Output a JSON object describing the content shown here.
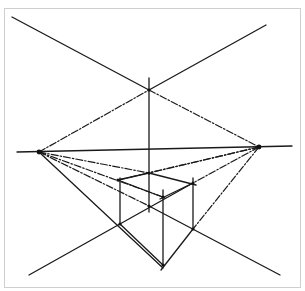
{
  "figure": {
    "colors": {
      "ink": "#1a1a1a",
      "background": "#ffffff",
      "frame": "#cfcfcf"
    }
  },
  "points": {
    "left_vp": {
      "x": 39,
      "y": 152
    },
    "right_vp": {
      "x": 259,
      "y": 147
    },
    "top_cross": {
      "x": 149,
      "y": 90
    },
    "box_top_back": {
      "x": 149,
      "y": 173
    },
    "box_top_left": {
      "x": 118,
      "y": 180
    },
    "box_top_right": {
      "x": 193,
      "y": 183
    },
    "box_top_front": {
      "x": 163,
      "y": 197
    },
    "box_bottom_back": {
      "x": 149,
      "y": 206
    },
    "box_bottom_left": {
      "x": 120,
      "y": 224
    },
    "box_bottom_right": {
      "x": 193,
      "y": 229
    },
    "box_bottom_front": {
      "x": 163,
      "y": 265
    }
  },
  "lines": {
    "solid": [
      {
        "name": "horizon-line",
        "x1": 17,
        "y1": 152,
        "x2": 292,
        "y2": 146
      },
      {
        "name": "upper-left-diagonal",
        "x1": 12,
        "y1": 17,
        "x2": 149,
        "y2": 90
      },
      {
        "name": "upper-right-diagonal",
        "x1": 266,
        "y1": 25,
        "x2": 149,
        "y2": 90
      },
      {
        "name": "center-vertical",
        "x1": 149,
        "y1": 78,
        "x2": 149,
        "y2": 212
      },
      {
        "name": "lower-left-diagonal",
        "x1": 29,
        "y1": 275,
        "x2": 193,
        "y2": 183
      },
      {
        "name": "lower-right-diagonal",
        "x1": 149,
        "y1": 206,
        "x2": 280,
        "y2": 275
      },
      {
        "name": "left-vp-to-front-bottom",
        "x1": 39,
        "y1": 152,
        "x2": 163,
        "y2": 268
      },
      {
        "name": "box-edge-left-vertical",
        "x1": 120,
        "y1": 178,
        "x2": 120,
        "y2": 224
      },
      {
        "name": "box-edge-front-vertical",
        "x1": 163,
        "y1": 190,
        "x2": 163,
        "y2": 265
      },
      {
        "name": "box-edge-right-vertical",
        "x1": 193,
        "y1": 178,
        "x2": 193,
        "y2": 229
      },
      {
        "name": "box-top-left-to-back",
        "x1": 118,
        "y1": 180,
        "x2": 149,
        "y2": 173
      },
      {
        "name": "box-top-back-to-right",
        "x1": 149,
        "y1": 173,
        "x2": 196,
        "y2": 185
      },
      {
        "name": "box-top-left-to-front",
        "x1": 118,
        "y1": 180,
        "x2": 165,
        "y2": 198
      },
      {
        "name": "box-top-front-to-right",
        "x1": 160,
        "y1": 199,
        "x2": 193,
        "y2": 183
      },
      {
        "name": "box-bottom-left-to-front",
        "x1": 120,
        "y1": 224,
        "x2": 163,
        "y2": 265
      },
      {
        "name": "box-bottom-right-to-front",
        "x1": 193,
        "y1": 229,
        "x2": 161,
        "y2": 270
      }
    ],
    "dashed": [
      {
        "name": "left-vp-to-top-cross",
        "x1": 39,
        "y1": 152,
        "x2": 149,
        "y2": 90
      },
      {
        "name": "top-cross-to-right-vp",
        "x1": 149,
        "y1": 90,
        "x2": 259,
        "y2": 147
      },
      {
        "name": "left-vp-to-top-back",
        "x1": 39,
        "y1": 152,
        "x2": 149,
        "y2": 173
      },
      {
        "name": "left-vp-to-top-front",
        "x1": 39,
        "y1": 152,
        "x2": 163,
        "y2": 197
      },
      {
        "name": "left-vp-to-bottom-back",
        "x1": 39,
        "y1": 152,
        "x2": 149,
        "y2": 206
      },
      {
        "name": "right-vp-to-top-back",
        "x1": 259,
        "y1": 147,
        "x2": 149,
        "y2": 173
      },
      {
        "name": "right-vp-to-top-left",
        "x1": 259,
        "y1": 147,
        "x2": 118,
        "y2": 180
      },
      {
        "name": "right-vp-to-top-right",
        "x1": 259,
        "y1": 147,
        "x2": 193,
        "y2": 183
      },
      {
        "name": "right-vp-to-bottom-right",
        "x1": 259,
        "y1": 147,
        "x2": 193,
        "y2": 229
      }
    ]
  }
}
